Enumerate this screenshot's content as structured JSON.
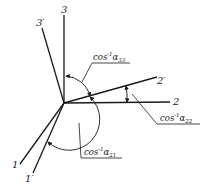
{
  "diagram": {
    "type": "coordinate-axes-rotation",
    "origin": [
      64,
      103
    ],
    "axes": [
      {
        "id": "3",
        "label": "3",
        "end": [
          64,
          15
        ],
        "label_pos": [
          61,
          13
        ]
      },
      {
        "id": "3p",
        "label": "3′",
        "end": [
          42,
          28
        ],
        "label_pos": [
          36,
          26
        ]
      },
      {
        "id": "2",
        "label": "2",
        "end": [
          170,
          102
        ],
        "label_pos": [
          174,
          105
        ]
      },
      {
        "id": "2p",
        "label": "2′",
        "end": [
          157,
          77
        ],
        "label_pos": [
          158,
          82
        ]
      },
      {
        "id": "1",
        "label": "1",
        "end": [
          20,
          164
        ],
        "label_pos": [
          12,
          168
        ]
      },
      {
        "id": "1p",
        "label": "1′",
        "end": [
          33,
          173
        ],
        "label_pos": [
          25,
          181
        ]
      }
    ],
    "annotations": [
      {
        "id": "a33",
        "text_main": "cos",
        "text_sup": "-1",
        "text_var": "α",
        "text_sub": "33"
      },
      {
        "id": "a22",
        "text_main": "cos",
        "text_sup": "-1",
        "text_var": "α",
        "text_sub": "22"
      },
      {
        "id": "a21",
        "text_main": "cos",
        "text_sup": "-1",
        "text_var": "α",
        "text_sub": "21"
      }
    ],
    "colors": {
      "ink": "#1a1a1a",
      "background": "#ffffff"
    }
  }
}
